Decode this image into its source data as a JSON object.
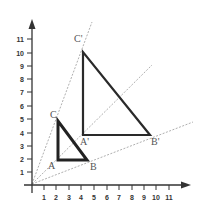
{
  "diagram": {
    "colors": {
      "axis": "#333333",
      "triangle": "#222222",
      "ray": "#9a9a9a",
      "label": "#555555"
    },
    "x_axis": {
      "ticks": [
        "1",
        "2",
        "3",
        "4",
        "5",
        "6",
        "7",
        "8",
        "9",
        "10",
        "11"
      ]
    },
    "y_axis": {
      "ticks": [
        "1",
        "2",
        "3",
        "4",
        "5",
        "6",
        "7",
        "8",
        "9",
        "10",
        "11"
      ]
    },
    "small_triangle": {
      "labels": {
        "A": "A",
        "B": "B",
        "C": "C"
      },
      "vertices": {
        "A": [
          2,
          2
        ],
        "B": [
          4.4,
          2
        ],
        "C": [
          2,
          5
        ]
      }
    },
    "large_triangle": {
      "labels": {
        "A": "A'",
        "B": "B'",
        "C": "C'"
      },
      "vertices": {
        "A": [
          4,
          3.8
        ],
        "B": [
          9.5,
          3.8
        ],
        "C": [
          4,
          10
        ]
      }
    },
    "rays": [
      "through C and C'",
      "through A and A'",
      "through B and B'"
    ]
  }
}
